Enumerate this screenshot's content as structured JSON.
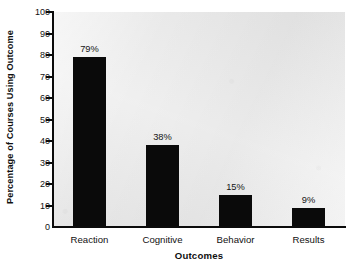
{
  "chart_data": {
    "type": "bar",
    "title": "",
    "xlabel": "Outcomes",
    "ylabel": "Percentage of Courses Using Outcome",
    "categories": [
      "Reaction",
      "Cognitive",
      "Behavior",
      "Results"
    ],
    "values": [
      79,
      38,
      15,
      9
    ],
    "data_labels": [
      "79%",
      "38%",
      "15%",
      "9%"
    ],
    "ylim": [
      0,
      100
    ],
    "ytick_values": [
      0,
      10,
      20,
      30,
      40,
      50,
      60,
      70,
      80,
      90,
      100
    ],
    "ytick_labels": [
      "0",
      "10",
      "20",
      "30",
      "40",
      "50",
      "60",
      "70",
      "80",
      "90",
      "100"
    ],
    "grid": false,
    "legend": false,
    "legend_position": "none",
    "series": [
      {
        "name": "Percentage of Courses Using Outcome",
        "values": [
          79,
          38,
          15,
          9
        ]
      }
    ],
    "colors": {
      "bar": "#0a0a0a",
      "plot_background": "#e9e9e9",
      "figure_background": "#ffffff",
      "axis": "#0b0b0b",
      "text": "#111111"
    }
  }
}
